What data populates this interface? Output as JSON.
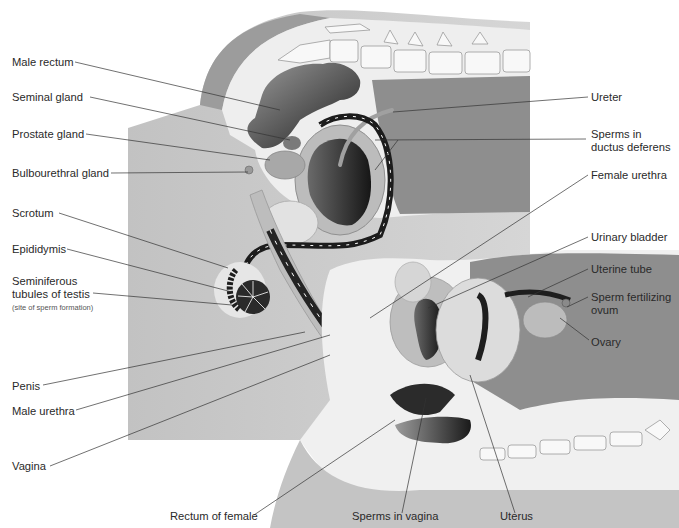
{
  "figure": {
    "colors": {
      "background": "#ffffff",
      "body_outer": "#b8b8b8",
      "body_mid": "#c9c9c9",
      "body_light": "#ececec",
      "cavity": "#8c8c8c",
      "dark_organ": "#2e2e2e",
      "organ_mid": "#a6a6a6",
      "duct": "#1c1c1c",
      "bone": "#f7f7f7",
      "bone_stroke": "#9a9a9a",
      "leader": "#333333",
      "text": "#2a2a2a"
    }
  },
  "labels": {
    "male_rectum": "Male rectum",
    "seminal_gland": "Seminal gland",
    "prostate_gland": "Prostate gland",
    "bulbourethral_gland": "Bulbourethral gland",
    "scrotum": "Scrotum",
    "epididymis": "Epididymis",
    "seminiferous_line1": "Seminiferous",
    "seminiferous_line2": "tubules of testis",
    "seminiferous_note": "(site of sperm formation)",
    "penis": "Penis",
    "male_urethra": "Male urethra",
    "vagina": "Vagina",
    "rectum_of_female": "Rectum of female",
    "sperms_in_vagina": "Sperms in vagina",
    "uterus": "Uterus",
    "ureter": "Ureter",
    "sperms_ductus_line1": "Sperms in",
    "sperms_ductus_line2": "ductus deferens",
    "female_urethra": "Female urethra",
    "urinary_bladder": "Urinary bladder",
    "uterine_tube": "Uterine tube",
    "sperm_fert_line1": "Sperm fertilizing",
    "sperm_fert_line2": "ovum",
    "ovary": "Ovary"
  },
  "leaders": [
    {
      "name": "male-rectum",
      "x1": 75,
      "y1": 62,
      "x2": 280,
      "y2": 110
    },
    {
      "name": "seminal-gland",
      "x1": 90,
      "y1": 97,
      "x2": 290,
      "y2": 140
    },
    {
      "name": "prostate-gland",
      "x1": 86,
      "y1": 134,
      "x2": 270,
      "y2": 160
    },
    {
      "name": "bulbourethral-gland",
      "x1": 111,
      "y1": 173,
      "x2": 248,
      "y2": 172
    },
    {
      "name": "scrotum",
      "x1": 59,
      "y1": 213,
      "x2": 228,
      "y2": 268
    },
    {
      "name": "epididymis",
      "x1": 67,
      "y1": 249,
      "x2": 232,
      "y2": 292
    },
    {
      "name": "seminiferous",
      "x1": 93,
      "y1": 293,
      "x2": 232,
      "y2": 305
    },
    {
      "name": "penis",
      "x1": 43,
      "y1": 385,
      "x2": 305,
      "y2": 332
    },
    {
      "name": "male-urethra",
      "x1": 76,
      "y1": 410,
      "x2": 330,
      "y2": 335
    },
    {
      "name": "vagina",
      "x1": 50,
      "y1": 466,
      "x2": 330,
      "y2": 355
    },
    {
      "name": "rectum-female",
      "x1": 254,
      "y1": 515,
      "x2": 395,
      "y2": 420
    },
    {
      "name": "sperms-vagina",
      "x1": 402,
      "y1": 513,
      "x2": 426,
      "y2": 398
    },
    {
      "name": "uterus",
      "x1": 515,
      "y1": 513,
      "x2": 470,
      "y2": 375
    },
    {
      "name": "ureter",
      "x1": 588,
      "y1": 97,
      "x2": 393,
      "y2": 112
    },
    {
      "name": "sperms-ductus",
      "x1": 586,
      "y1": 139,
      "x2": 375,
      "y2": 140
    },
    {
      "name": "sperms-ductus-2",
      "x1": 398,
      "y1": 140,
      "x2": 375,
      "y2": 170
    },
    {
      "name": "female-urethra",
      "x1": 588,
      "y1": 175,
      "x2": 370,
      "y2": 318
    },
    {
      "name": "urinary-bladder",
      "x1": 588,
      "y1": 237,
      "x2": 428,
      "y2": 308
    },
    {
      "name": "uterine-tube",
      "x1": 588,
      "y1": 269,
      "x2": 528,
      "y2": 297
    },
    {
      "name": "sperm-fert",
      "x1": 588,
      "y1": 297,
      "x2": 567,
      "y2": 307
    },
    {
      "name": "ovary",
      "x1": 589,
      "y1": 340,
      "x2": 560,
      "y2": 318
    }
  ]
}
